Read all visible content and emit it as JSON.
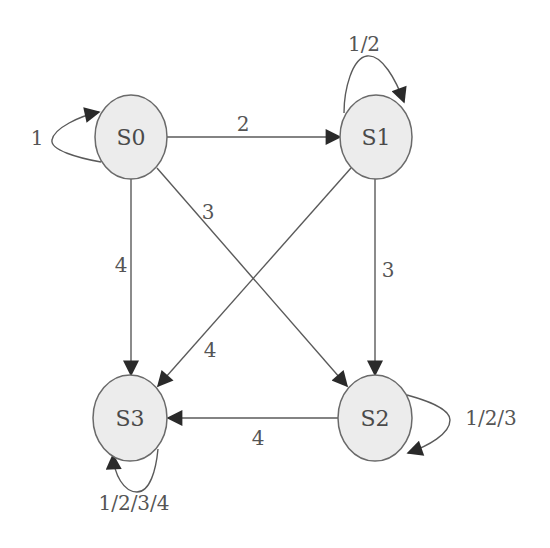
{
  "diagram": {
    "type": "state-transition-diagram",
    "colors": {
      "node_fill": "#ececec",
      "node_stroke": "#6a6a6a",
      "edge": "#5a5a5a",
      "arrowhead": "#2a2a2a",
      "text": "#4a4a4a"
    },
    "nodes": [
      {
        "id": "S0",
        "label": "S0"
      },
      {
        "id": "S1",
        "label": "S1"
      },
      {
        "id": "S2",
        "label": "S2"
      },
      {
        "id": "S3",
        "label": "S3"
      }
    ],
    "edges": [
      {
        "from": "S0",
        "to": "S0",
        "label": "1"
      },
      {
        "from": "S0",
        "to": "S1",
        "label": "2"
      },
      {
        "from": "S0",
        "to": "S2",
        "label": "3"
      },
      {
        "from": "S0",
        "to": "S3",
        "label": "4"
      },
      {
        "from": "S1",
        "to": "S1",
        "label": "1/2"
      },
      {
        "from": "S1",
        "to": "S2",
        "label": "3"
      },
      {
        "from": "S1",
        "to": "S3",
        "label": "4"
      },
      {
        "from": "S2",
        "to": "S2",
        "label": "1/2/3"
      },
      {
        "from": "S2",
        "to": "S3",
        "label": "4"
      },
      {
        "from": "S3",
        "to": "S3",
        "label": "1/2/3/4"
      }
    ]
  }
}
